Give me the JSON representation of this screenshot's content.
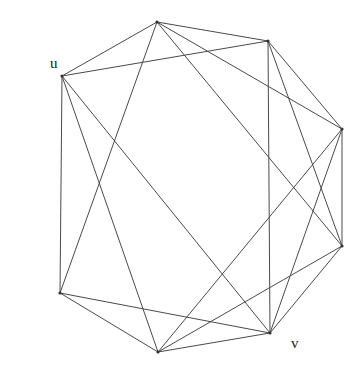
{
  "figure": {
    "kind": "undirected-graph-diagram",
    "background_color": "#ffffff",
    "edge_color": "#4a4a4a",
    "edge_width": 1,
    "vertex_color": "#333333",
    "vertex_radius": 1.6,
    "width": 361,
    "height": 374
  },
  "chart_data": {
    "type": "diagram",
    "title": "",
    "layout": "circular octagon",
    "node_count": 8,
    "edge_count": 20,
    "nodes": [
      {
        "id": "n0",
        "label": "",
        "x": 157,
        "y": 22
      },
      {
        "id": "n1",
        "label": "",
        "x": 268,
        "y": 41
      },
      {
        "id": "n2",
        "label": "",
        "x": 342,
        "y": 129
      },
      {
        "id": "n3",
        "label": "",
        "x": 342,
        "y": 246
      },
      {
        "id": "n4",
        "label": "v",
        "x": 270,
        "y": 333
      },
      {
        "id": "n5",
        "label": "",
        "x": 158,
        "y": 352
      },
      {
        "id": "n6",
        "label": "",
        "x": 60,
        "y": 293
      },
      {
        "id": "n7",
        "label": "u",
        "x": 62,
        "y": 76
      }
    ],
    "edges": [
      {
        "from": "n0",
        "to": "n1"
      },
      {
        "from": "n1",
        "to": "n2"
      },
      {
        "from": "n2",
        "to": "n3"
      },
      {
        "from": "n3",
        "to": "n4"
      },
      {
        "from": "n4",
        "to": "n5"
      },
      {
        "from": "n5",
        "to": "n6"
      },
      {
        "from": "n6",
        "to": "n7"
      },
      {
        "from": "n7",
        "to": "n0"
      },
      {
        "from": "n0",
        "to": "n2"
      },
      {
        "from": "n1",
        "to": "n3"
      },
      {
        "from": "n2",
        "to": "n4"
      },
      {
        "from": "n3",
        "to": "n5"
      },
      {
        "from": "n4",
        "to": "n6"
      },
      {
        "from": "n5",
        "to": "n7"
      },
      {
        "from": "n6",
        "to": "n0"
      },
      {
        "from": "n7",
        "to": "n1"
      },
      {
        "from": "n0",
        "to": "n3"
      },
      {
        "from": "n1",
        "to": "n4"
      },
      {
        "from": "n2",
        "to": "n5"
      },
      {
        "from": "n7",
        "to": "n4"
      }
    ],
    "annotations": [
      {
        "name": "u",
        "text": "u",
        "x": 50,
        "y": 56
      },
      {
        "name": "v",
        "text": "v",
        "x": 291,
        "y": 336
      }
    ]
  },
  "labels": {
    "u": "u",
    "v": "v"
  }
}
